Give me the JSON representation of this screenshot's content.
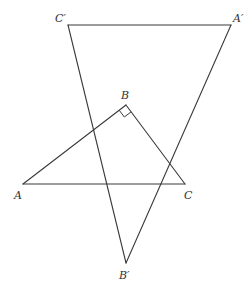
{
  "diagram": {
    "stroke_color": "#3a3a3a",
    "label_color": "#333333",
    "triangles": [
      {
        "name": "ABC",
        "vertices": {
          "A": {
            "label": "A",
            "x": 23,
            "y": 184
          },
          "B": {
            "label": "B",
            "x": 126,
            "y": 105
          },
          "C": {
            "label": "C",
            "x": 185,
            "y": 184
          }
        },
        "right_angle_at": "B"
      },
      {
        "name": "A'B'C'",
        "vertices": {
          "A'": {
            "label": "A′",
            "x": 231,
            "y": 25
          },
          "B'": {
            "label": "B′",
            "x": 126,
            "y": 263
          },
          "C'": {
            "label": "C′",
            "x": 68,
            "y": 25
          }
        }
      }
    ],
    "labels": {
      "A": "A",
      "B": "B",
      "C": "C",
      "A_prime": "A′",
      "B_prime": "B′",
      "C_prime": "C′"
    }
  }
}
